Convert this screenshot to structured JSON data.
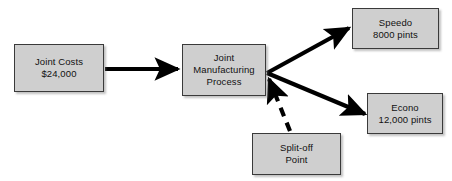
{
  "diagram": {
    "background_color": "#ffffff",
    "box_fill_color": "#cfcfcf",
    "box_border_color": "#3a3a3a",
    "connector_color": "#000000",
    "nodes": [
      {
        "id": "joint-costs",
        "lines": [
          "Joint Costs",
          "$24,000"
        ],
        "line1": "Joint Costs",
        "line2": "$24,000",
        "line3": ""
      },
      {
        "id": "joint-process",
        "lines": [
          "Joint",
          "Manufacturing",
          "Process"
        ],
        "line1": "Joint",
        "line2": "Manufacturing",
        "line3": "Process"
      },
      {
        "id": "speedo",
        "lines": [
          "Speedo",
          "8000 pints"
        ],
        "line1": "Speedo",
        "line2": "8000 pints",
        "line3": ""
      },
      {
        "id": "econo",
        "lines": [
          "Econo",
          "12,000 pints"
        ],
        "line1": "Econo",
        "line2": "12,000 pints",
        "line3": ""
      },
      {
        "id": "splitoff",
        "lines": [
          "Split-off",
          "Point"
        ],
        "line1": "Split-off",
        "line2": "Point",
        "line3": ""
      }
    ],
    "connectors": [
      {
        "id": "costs-to-process",
        "from": "joint-costs",
        "to": "joint-process",
        "style": "solid",
        "arrowhead": "end",
        "label": ""
      },
      {
        "id": "process-to-speedo",
        "from": "joint-process",
        "to": "speedo",
        "style": "solid",
        "arrowhead": "end",
        "label": ""
      },
      {
        "id": "process-to-econo",
        "from": "joint-process",
        "to": "econo",
        "style": "solid",
        "arrowhead": "end",
        "label": ""
      },
      {
        "id": "splitoff-to-process",
        "from": "splitoff",
        "to": "joint-process",
        "style": "dashed",
        "arrowhead": "end",
        "label": ""
      }
    ]
  }
}
